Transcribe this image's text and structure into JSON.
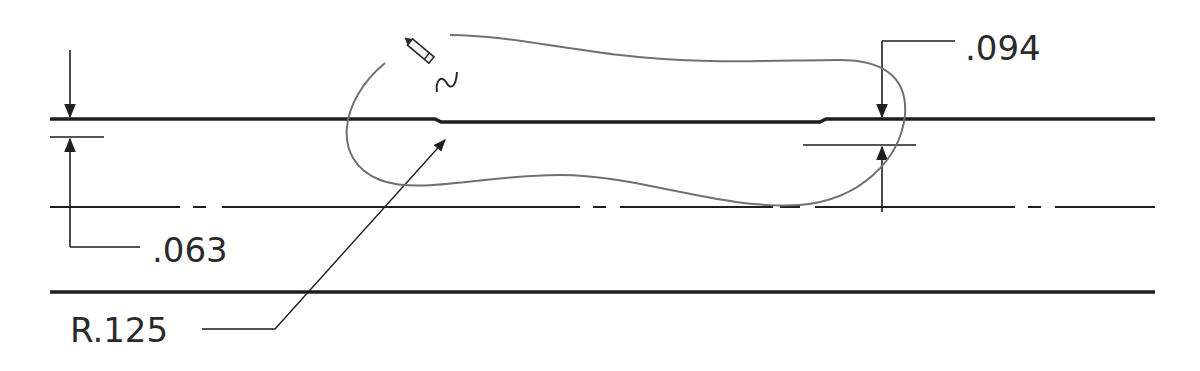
{
  "drawing": {
    "type": "engineering dimension drawing",
    "colors": {
      "ink": "#1e1e1e",
      "cloud": "#707070",
      "background": "#ffffff"
    },
    "dimensions": [
      {
        "id": "left-thickness",
        "label": ".063"
      },
      {
        "id": "right-thickness",
        "label": ".094"
      },
      {
        "id": "radius",
        "label": "R.125"
      }
    ],
    "annotations": [
      {
        "id": "revision-cloud",
        "icon": "pencil-icon"
      }
    ],
    "lines": [
      "top-edge",
      "centerline",
      "bottom-edge"
    ]
  }
}
